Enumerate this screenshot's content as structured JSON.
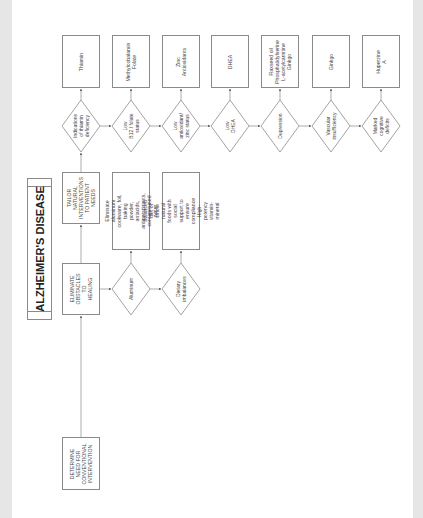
{
  "title": "ALZHEIMER'S DISEASE",
  "steps": {
    "determine": "DETERMINE\nNEED FOR\nCONVENTIONAL\nINTERVENTION",
    "eliminate": "ELIMINATE\nOBSTACLES\nTO HEALING",
    "tailor": "TAILOR\nNATURAL\nINTERVENTIONS\nTO PATIENT\nNEEDS"
  },
  "obstacles": [
    {
      "condition": "Aluminum",
      "intervention": "Eliminate aluminum\ncookware, foil, baking\npowder, antacids,\nantiperspirants,\ncontaminated water"
    },
    {
      "condition": "Dietary\nimbalances",
      "intervention": "Balanced diet of whole\nnatural foods with social\nsupport to ensure\ncompliance\nHigh-potency vitamin-mineral"
    }
  ],
  "conditions": [
    {
      "condition": "Indications\nof thiamin\ndeficiency",
      "intervention": "Thiamin"
    },
    {
      "condition": "Low\nB12 / folate\nstatus",
      "intervention": "Methylcobalamin\nFolate"
    },
    {
      "condition": "Low\nantioxidant/\nzinc status",
      "intervention": "Zinc\nAntioxidants"
    },
    {
      "condition": "Low\nDHEA",
      "intervention": "DHEA"
    },
    {
      "condition": "Depression",
      "intervention": "Flaxseed oil\nPhosphatidylserine\nL-acetylcarnitine\nGinkgo"
    },
    {
      "condition": "Vascular\ninsufficiency",
      "intervention": "Ginkgo"
    },
    {
      "condition": "Marked\ncognitive\ndeficits",
      "intervention": "Huperzine A"
    }
  ],
  "colors": {
    "line": "#8a8a8a",
    "text": "#444444",
    "margin": "#e6e6e6"
  }
}
